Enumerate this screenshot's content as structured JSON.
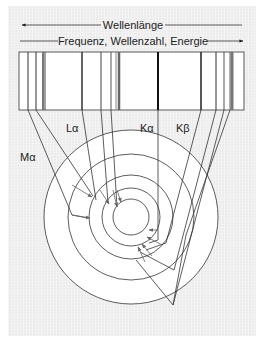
{
  "header": {
    "wavelength_label": "Wellenlänge",
    "frequency_label": "Frequenz, Wellenzahl, Energie"
  },
  "labels": {
    "l_alpha": "Lα",
    "k_alpha": "Kα",
    "k_beta": "Kβ",
    "m_alpha": "Mα"
  },
  "spectrum": {
    "box": {
      "x": 19,
      "y": 52,
      "w": 225,
      "h": 58
    },
    "lines": [
      {
        "x": 28,
        "w": 1,
        "shade": "#333"
      },
      {
        "x": 36,
        "w": 1,
        "shade": "#333"
      },
      {
        "x": 43,
        "w": 2,
        "shade": "#777"
      },
      {
        "x": 45,
        "w": 1,
        "shade": "#444"
      },
      {
        "x": 82,
        "w": 1.5,
        "shade": "#333"
      },
      {
        "x": 101,
        "w": 1,
        "shade": "#444"
      },
      {
        "x": 111,
        "w": 1,
        "shade": "#555"
      },
      {
        "x": 116,
        "w": 1,
        "shade": "#888"
      },
      {
        "x": 119,
        "w": 2.5,
        "shade": "#666"
      },
      {
        "x": 158,
        "w": 2,
        "shade": "#111"
      },
      {
        "x": 201,
        "w": 1.5,
        "shade": "#222"
      },
      {
        "x": 216,
        "w": 1,
        "shade": "#333"
      },
      {
        "x": 224,
        "w": 1,
        "shade": "#555"
      },
      {
        "x": 230,
        "w": 1,
        "shade": "#666"
      },
      {
        "x": 232,
        "w": 3,
        "shade": "#777"
      }
    ]
  },
  "atom": {
    "cx": 131,
    "cy": 217,
    "radii": [
      87,
      63,
      42,
      29,
      18
    ]
  },
  "colors": {
    "line": "#333333",
    "arrow": "#555555",
    "background": "#ececec"
  }
}
